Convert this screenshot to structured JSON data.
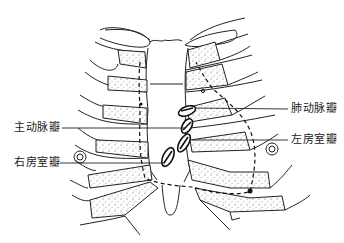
{
  "figure": {
    "labels": [
      {
        "id": "pulmonary",
        "text": "肺动脉瓣",
        "side": "right"
      },
      {
        "id": "aortic",
        "text": "主动脉瓣",
        "side": "left"
      },
      {
        "id": "mitral",
        "text": "左房室瓣",
        "side": "right"
      },
      {
        "id": "tricuspid",
        "text": "右房室瓣",
        "side": "left"
      }
    ]
  },
  "colors": {
    "line": "#222222",
    "background": "#ffffff"
  }
}
